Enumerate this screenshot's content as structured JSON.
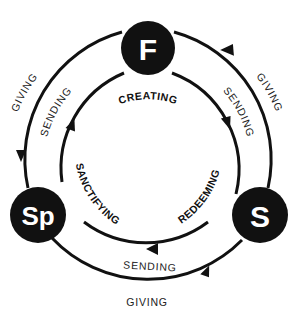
{
  "diagram": {
    "nodes": [
      {
        "id": "father",
        "label": "F"
      },
      {
        "id": "son",
        "label": "S"
      },
      {
        "id": "spirit",
        "label": "Sp"
      }
    ],
    "inner_labels": {
      "creating": "CREATING",
      "redeeming": "REDEEMING",
      "sanctifying": "SANCTIFYING"
    },
    "outer_cycle_labels": {
      "giving_right": "GIVING",
      "giving_left": "GIVING",
      "giving_bottom": "GIVING"
    },
    "middle_cycle_labels": {
      "sending_right": "SENDING",
      "sending_left": "SENDING",
      "sending_bottom": "SENDING"
    },
    "colors": {
      "ink": "#111111",
      "background": "#ffffff"
    }
  }
}
